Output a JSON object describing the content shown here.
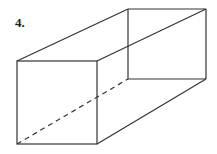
{
  "problem": {
    "number_label": "4."
  },
  "figure": {
    "type": "rectangular-prism",
    "stroke_color": "#333333",
    "front_face": {
      "tl": [
        17,
        61
      ],
      "tr": [
        97,
        61
      ],
      "br": [
        97,
        144
      ],
      "bl": [
        17,
        144
      ]
    },
    "back_face": {
      "tl": [
        128,
        9
      ],
      "tr": [
        206,
        9
      ],
      "br": [
        206,
        79
      ],
      "bl": [
        128,
        79
      ]
    },
    "hidden_edges": [
      "back-bottom-left to front-bottom-left"
    ]
  }
}
